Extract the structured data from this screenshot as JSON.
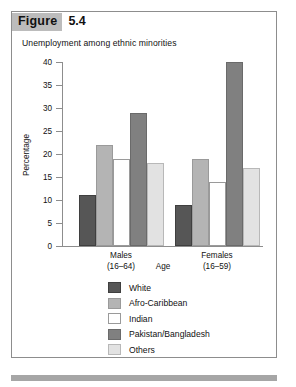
{
  "figure": {
    "tag_label": "Figure",
    "number": "5.4"
  },
  "chart_data": {
    "type": "bar",
    "title": "Unemployment among ethnic minorities",
    "xlabel": "Age",
    "ylabel": "Percentage",
    "ylim": [
      0,
      40
    ],
    "yticks": [
      0,
      5,
      10,
      15,
      20,
      25,
      30,
      35,
      40
    ],
    "ytick_labels": [
      "0",
      "5",
      "10",
      "15",
      "20",
      "25",
      "30",
      "35",
      "40"
    ],
    "grid": false,
    "legend_position": "bottom-center",
    "categories": [
      "Males (16–64)",
      "Females (16–59)"
    ],
    "category_lines": [
      [
        "Males",
        "(16–64)"
      ],
      [
        "Females",
        "(16–59)"
      ]
    ],
    "series": [
      {
        "name": "White",
        "values": [
          11,
          9
        ],
        "color": "#565656",
        "border": "#3f3f3f"
      },
      {
        "name": "Afro-Caribbean",
        "values": [
          22,
          19
        ],
        "color": "#b4b4b4",
        "border": "#9a9a9a"
      },
      {
        "name": "Indian",
        "values": [
          19,
          14
        ],
        "color": "#ffffff",
        "border": "#9a9a9a"
      },
      {
        "name": "Pakistan/Bangladesh",
        "values": [
          29,
          40
        ],
        "color": "#808080",
        "border": "#6a6a6a"
      },
      {
        "name": "Others",
        "values": [
          18,
          17
        ],
        "color": "#e2e2e2",
        "border": "#b8b8b8"
      }
    ]
  }
}
